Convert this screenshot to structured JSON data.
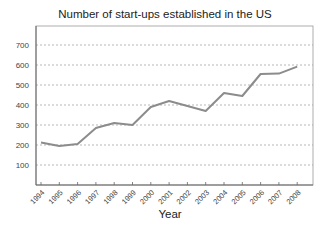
{
  "chart_data": {
    "type": "line",
    "title": "Number of start-ups established in the US",
    "xlabel": "Year",
    "ylabel": "",
    "categories": [
      "1994",
      "1995",
      "1996",
      "1997",
      "1998",
      "1999",
      "2000",
      "2001",
      "2002",
      "2003",
      "2004",
      "2005",
      "2006",
      "2007",
      "2008"
    ],
    "series": [
      {
        "name": "Start-ups",
        "values": [
          213,
          195,
          205,
          285,
          310,
          300,
          390,
          420,
          395,
          370,
          460,
          445,
          555,
          557,
          592
        ],
        "color": "#8c8c8c"
      }
    ],
    "yticks": [
      100,
      200,
      300,
      400,
      500,
      600,
      700
    ],
    "ylim": [
      0,
      800
    ],
    "grid": "horizontal dashed",
    "legend": "none"
  }
}
